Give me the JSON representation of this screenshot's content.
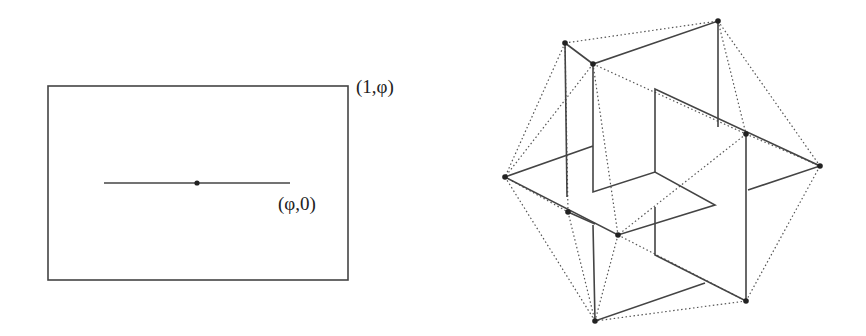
{
  "left_figure": {
    "rectangle": {
      "x": 48,
      "y": 86,
      "w": 300,
      "h": 194
    },
    "segment": {
      "x1": 104,
      "y1": 183,
      "x2": 290,
      "y2": 183
    },
    "center_point": {
      "x": 197,
      "y": 183
    },
    "corner_label": "(1,φ)",
    "segment_label": "(φ,0)"
  },
  "right_figure": {
    "vertices": {
      "A": [
        565,
        43
      ],
      "B": [
        593,
        64
      ],
      "C": [
        718,
        21
      ],
      "D": [
        746,
        134
      ],
      "E": [
        505,
        177
      ],
      "F": [
        568,
        212
      ],
      "G": [
        618,
        235
      ],
      "H": [
        746,
        301
      ],
      "I": [
        595,
        321
      ],
      "J": [
        820,
        166
      ]
    },
    "solid_polylines": [
      [
        [
          565,
          43
        ],
        [
          593,
          64
        ],
        [
          718,
          21
        ],
        [
          718,
          127
        ]
      ],
      [
        [
          565,
          43
        ],
        [
          567,
          197
        ]
      ],
      [
        [
          593,
          64
        ],
        [
          593,
          192
        ],
        [
          655,
          172
        ],
        [
          715,
          205
        ],
        [
          618,
          235
        ],
        [
          505,
          177
        ],
        [
          593,
          146
        ]
      ],
      [
        [
          655,
          172
        ],
        [
          655,
          89
        ],
        [
          820,
          166
        ],
        [
          748,
          190
        ]
      ],
      [
        [
          655,
          207
        ],
        [
          655,
          255
        ],
        [
          746,
          301
        ],
        [
          746,
          134
        ]
      ],
      [
        [
          593,
          225
        ],
        [
          595,
          321
        ],
        [
          705,
          283
        ]
      ],
      [
        [
          568,
          212
        ],
        [
          595,
          224
        ]
      ]
    ],
    "dotted_edges": [
      [
        [
          565,
          43
        ],
        [
          718,
          21
        ]
      ],
      [
        [
          565,
          43
        ],
        [
          505,
          177
        ]
      ],
      [
        [
          565,
          43
        ],
        [
          568,
          212
        ]
      ],
      [
        [
          593,
          64
        ],
        [
          505,
          177
        ]
      ],
      [
        [
          593,
          64
        ],
        [
          618,
          235
        ]
      ],
      [
        [
          593,
          64
        ],
        [
          746,
          134
        ]
      ],
      [
        [
          718,
          21
        ],
        [
          746,
          134
        ]
      ],
      [
        [
          718,
          21
        ],
        [
          820,
          166
        ]
      ],
      [
        [
          746,
          134
        ],
        [
          820,
          166
        ]
      ],
      [
        [
          746,
          134
        ],
        [
          618,
          235
        ]
      ],
      [
        [
          505,
          177
        ],
        [
          568,
          212
        ]
      ],
      [
        [
          505,
          177
        ],
        [
          595,
          321
        ]
      ],
      [
        [
          568,
          212
        ],
        [
          595,
          321
        ]
      ],
      [
        [
          618,
          235
        ],
        [
          595,
          321
        ]
      ],
      [
        [
          618,
          235
        ],
        [
          746,
          301
        ]
      ],
      [
        [
          746,
          301
        ],
        [
          820,
          166
        ]
      ],
      [
        [
          746,
          301
        ],
        [
          595,
          321
        ]
      ]
    ],
    "stroke_color": "#444444"
  }
}
